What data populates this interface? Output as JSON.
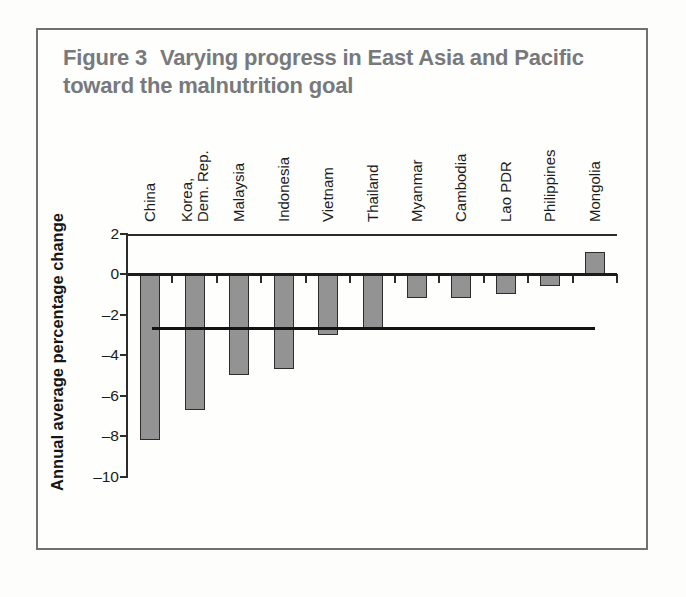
{
  "figure": {
    "label": "Figure 3",
    "title": "Varying progress in East Asia and Pacific toward the malnutrition goal",
    "title_line1": "Varying progress in East Asia and Pacific",
    "title_line2": "toward the malnutrition goal"
  },
  "chart_data": {
    "type": "bar",
    "categories": [
      "China",
      "Korea,\nDem. Rep.",
      "Malaysia",
      "Indonesia",
      "Vietnam",
      "Thailand",
      "Myanmar",
      "Cambodia",
      "Lao PDR",
      "Philippines",
      "Mongolia"
    ],
    "values": [
      -8.2,
      -6.7,
      -5.0,
      -4.7,
      -3.0,
      -2.7,
      -1.2,
      -1.2,
      -1.0,
      -0.6,
      1.1
    ],
    "xlabel": "",
    "ylabel": "Annual average percentage change",
    "ylim": [
      -10,
      2
    ],
    "yticks": [
      {
        "label": "2",
        "value": 2
      },
      {
        "label": "0",
        "value": 0
      },
      {
        "label": "–2",
        "value": -2
      },
      {
        "label": "–4",
        "value": -4
      },
      {
        "label": "–6",
        "value": -6
      },
      {
        "label": "–8",
        "value": -8
      },
      {
        "label": "–10",
        "value": -10
      }
    ],
    "reference_line": -2.7,
    "grid": false,
    "legend": "none",
    "colors": {
      "bar_fill": "#939393",
      "bar_border": "#2c2c2c",
      "axis": "#1b1b1b",
      "reference_line": "#131313",
      "figure_title": "#77797c",
      "figure_border": "#6f7173",
      "background": "#fefefd"
    }
  }
}
